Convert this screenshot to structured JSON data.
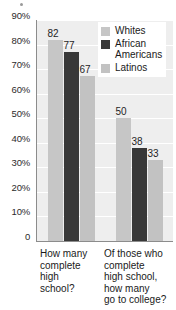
{
  "chart_data": {
    "type": "bar",
    "title": "",
    "subtitle": "",
    "xlabel": "",
    "ylabel": "",
    "ylim": [
      0,
      90
    ],
    "grid": true,
    "legend_position": "top-right",
    "categories": [
      "How many\ncomplete\nhigh\nschool?",
      "Of those who\ncomplete\nhigh school,\nhow many\ngo to college?"
    ],
    "series": [
      {
        "name": "Whites",
        "color": "#c6c6c6",
        "values": [
          82,
          50
        ]
      },
      {
        "name": "African\nAmericans",
        "color": "#383838",
        "values": [
          77,
          38
        ]
      },
      {
        "name": "Latinos",
        "color": "#c2c2c2",
        "values": [
          67,
          33
        ]
      }
    ],
    "y_ticks": [
      {
        "value": 90,
        "label": "90%"
      },
      {
        "value": 80,
        "label": "80%"
      },
      {
        "value": 70,
        "label": "70%"
      },
      {
        "value": 60,
        "label": "60%"
      },
      {
        "value": 50,
        "label": "50%"
      },
      {
        "value": 40,
        "label": "40%"
      },
      {
        "value": 30,
        "label": "30%"
      },
      {
        "value": 20,
        "label": "20%"
      },
      {
        "value": 10,
        "label": "10%"
      },
      {
        "value": 0,
        "label": "0"
      }
    ],
    "data_labels": [
      {
        "group": 0,
        "series": 0,
        "text": "82"
      },
      {
        "group": 0,
        "series": 1,
        "text": "77"
      },
      {
        "group": 0,
        "series": 2,
        "text": "67"
      },
      {
        "group": 1,
        "series": 0,
        "text": "50"
      },
      {
        "group": 1,
        "series": 1,
        "text": "38"
      },
      {
        "group": 1,
        "series": 2,
        "text": "33"
      }
    ],
    "colors": {
      "plot_background": "#eeeeee",
      "gridline": "#ffffff",
      "axis": "#8c8c8c",
      "text": "#1a1a1a"
    }
  }
}
